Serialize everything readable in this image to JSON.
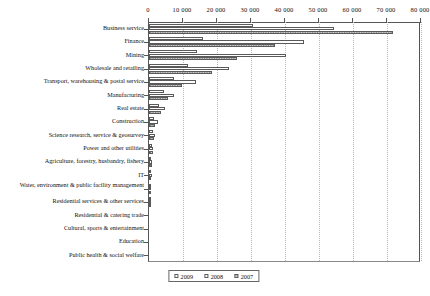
{
  "chart_data": {
    "type": "bar",
    "orientation": "horizontal",
    "title": "",
    "xlabel": "",
    "ylabel": "",
    "xlim": [
      0,
      80000
    ],
    "xticks": [
      "0",
      "10 000",
      "20 000",
      "30 000",
      "40 000",
      "50 000",
      "60 000",
      "70 000",
      "80 000"
    ],
    "xtick_values": [
      0,
      10000,
      20000,
      30000,
      40000,
      50000,
      60000,
      70000,
      80000
    ],
    "grid": "vertical-dotted",
    "legend_position": "bottom-center",
    "categories": [
      "Business service",
      "Finance",
      "Mining",
      "Wholesale and retailing",
      "Transport, warehousing & postal service",
      "Manufacturing",
      "Real estate",
      "Construction",
      "Science research, service & geosurvey",
      "Power and other utilities",
      "Agriculture, forestry, husbandry, fishery",
      "IT",
      "Water, environment & public facility management",
      "Residential services & other services",
      "Residential & catering trade",
      "Cultural, sports & entertainment",
      "Education",
      "Public health & social welfare"
    ],
    "series": [
      {
        "name": "2009",
        "values": [
          30500,
          16000,
          14200,
          11400,
          7300,
          4500,
          2900,
          1600,
          1200,
          900,
          700,
          600,
          500,
          350,
          0,
          0,
          0,
          0
        ]
      },
      {
        "name": "2008",
        "values": [
          54500,
          45500,
          40200,
          23500,
          13800,
          7400,
          4600,
          2500,
          1700,
          1300,
          1000,
          800,
          650,
          450,
          0,
          0,
          0,
          0
        ]
      },
      {
        "name": "2007",
        "values": [
          71800,
          37000,
          25800,
          18500,
          9800,
          5600,
          3400,
          1900,
          1400,
          1050,
          820,
          640,
          520,
          380,
          0,
          0,
          0,
          0
        ]
      }
    ]
  },
  "legend": {
    "items": [
      {
        "label": "2009",
        "style": "hollow"
      },
      {
        "label": "2008",
        "style": "hollow"
      },
      {
        "label": "2007",
        "style": "dotted-gray"
      }
    ]
  },
  "colors": {
    "axis": "#555555",
    "grid": "#b8b8b8",
    "bar_outline": "#5a5a5a",
    "bar_fill_hollow": "#ffffff",
    "bar_fill_2007": "#d9d9d9",
    "text": "#111111"
  }
}
